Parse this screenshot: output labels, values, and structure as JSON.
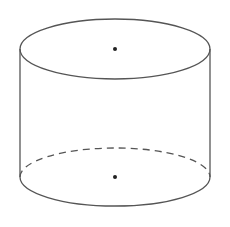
{
  "diagram": {
    "type": "cylinder",
    "colors": {
      "background": "#ffffff",
      "stroke": "#555555",
      "dot": "#222222"
    },
    "top_ellipse": {
      "cx": 115,
      "cy": 49,
      "rx": 95,
      "ry": 30
    },
    "bottom_ellipse": {
      "cx": 115,
      "cy": 177,
      "rx": 95,
      "ry": 29
    },
    "top_center_dot": {
      "x": 115,
      "y": 49,
      "r": 2
    },
    "bottom_center_dot": {
      "x": 115,
      "y": 177,
      "r": 2
    },
    "hidden_edge": "dashed"
  }
}
